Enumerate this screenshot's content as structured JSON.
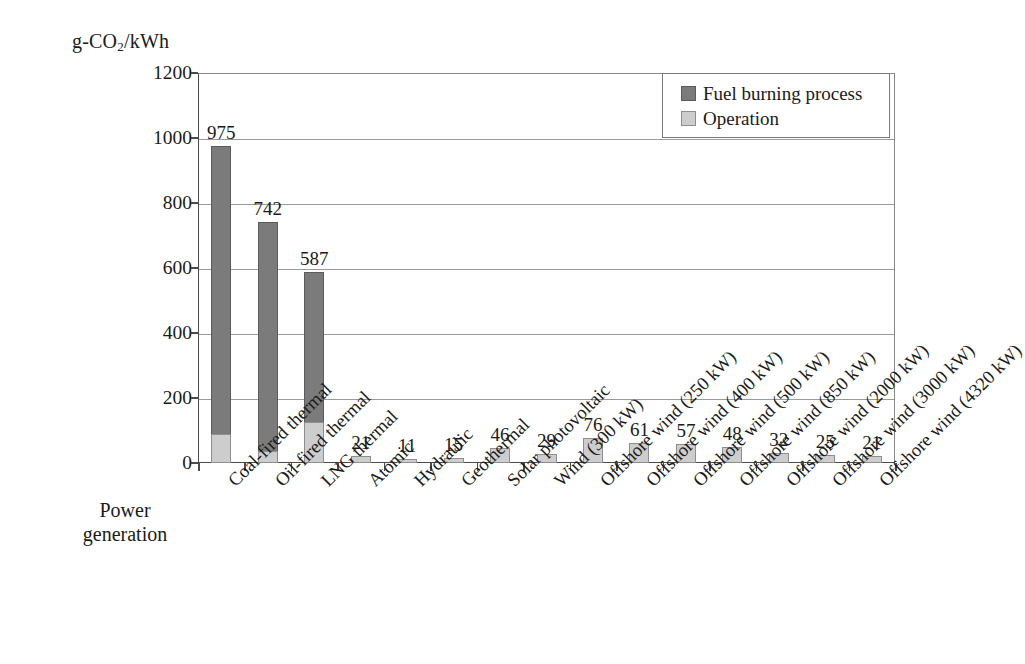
{
  "chart_data": {
    "type": "bar",
    "subtype": "stacked-bar",
    "title": "",
    "xlabel": "Power generation",
    "ylabel": "g-CO2/kWh",
    "ylabel_html": "g-CO<sub>2</sub>/kWh",
    "ylim": [
      0,
      1200
    ],
    "yticks": [
      0,
      200,
      400,
      600,
      800,
      1000,
      1200
    ],
    "ytick_labels": [
      "0",
      "200",
      "400",
      "600",
      "800",
      "1000",
      "1200"
    ],
    "grid": "horizontal",
    "legend_position": "top-right",
    "categories": [
      "Coal-fired thermal",
      "Oil-fired thermal",
      "LNG thermal",
      "Atomic",
      "Hydraulic",
      "Geothermal",
      "Solar photovoltaic",
      "Wind (300 kW)",
      "Offshore wind (250 kW)",
      "Offshore wind (400 kW)",
      "Offshore wind (500 kW)",
      "Offshore wind (850 kW)",
      "Offshore wind (2000 kW)",
      "Offshore wind (3000 kW)",
      "Offshore wind (4320 kW)"
    ],
    "series": [
      {
        "name": "Operation",
        "color": "#cdcdcd",
        "values": [
          88,
          38,
          125,
          21,
          11,
          15,
          46,
          29,
          76,
          61,
          57,
          48,
          32,
          25,
          21
        ]
      },
      {
        "name": "Fuel burning process",
        "color": "#7b7b7b",
        "values": [
          887,
          704,
          462,
          0,
          0,
          0,
          0,
          0,
          0,
          0,
          0,
          0,
          0,
          0,
          0
        ]
      }
    ],
    "totals": [
      975,
      742,
      587,
      21,
      11,
      15,
      46,
      29,
      76,
      61,
      57,
      48,
      32,
      25,
      21
    ],
    "total_labels": [
      "975",
      "742",
      "587",
      "21",
      "11",
      "15",
      "46",
      "29",
      "76",
      "61",
      "57",
      "48",
      "32",
      "25",
      "21"
    ]
  },
  "legend": {
    "items": [
      {
        "label": "Fuel burning process",
        "color": "#7b7b7b"
      },
      {
        "label": "Operation",
        "color": "#cdcdcd"
      }
    ]
  },
  "axis": {
    "x_title_line1": "Power",
    "x_title_line2": "generation"
  }
}
